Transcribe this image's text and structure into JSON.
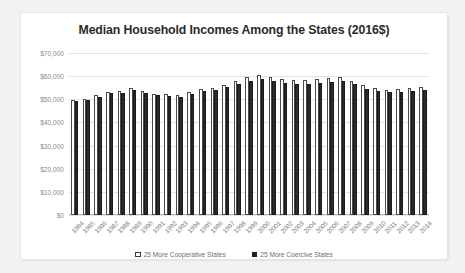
{
  "chart_data": {
    "type": "bar",
    "title": "Median Household Incomes Among the States (2016$)",
    "xlabel": "",
    "ylabel": "",
    "ylim": [
      0,
      70000
    ],
    "ytick_labels": [
      "$70,000",
      "$60,000",
      "$50,000",
      "$40,000",
      "$30,000",
      "$20,000",
      "$10,000",
      "$0"
    ],
    "ytick_values": [
      70000,
      60000,
      50000,
      40000,
      30000,
      20000,
      10000,
      0
    ],
    "grid": true,
    "legend_position": "bottom",
    "categories": [
      "1984",
      "1985",
      "1986",
      "1987",
      "1988",
      "1989",
      "1990",
      "1991",
      "1992",
      "1993",
      "1994",
      "1995",
      "1996",
      "1997",
      "1998",
      "1999",
      "2000",
      "2001",
      "2002",
      "2003",
      "2004",
      "2005",
      "2006",
      "2007",
      "2008",
      "2009",
      "2010",
      "2011",
      "2012",
      "2013",
      "2014"
    ],
    "series": [
      {
        "name": "25 More Cooperative States",
        "color": "#ffffff",
        "values": [
          49500,
          50300,
          52000,
          53200,
          53500,
          54800,
          53700,
          52500,
          52200,
          52000,
          53100,
          54300,
          55000,
          56200,
          58000,
          59800,
          60500,
          59500,
          58800,
          58400,
          58200,
          58600,
          59000,
          59500,
          57800,
          56000,
          55000,
          54200,
          54300,
          54700,
          55400
        ]
      },
      {
        "name": "25 More Coercive States",
        "color": "#2b2b2b",
        "values": [
          49200,
          49800,
          51200,
          52600,
          52800,
          54000,
          52900,
          51700,
          51400,
          51200,
          52200,
          53400,
          54100,
          55100,
          56800,
          58100,
          58600,
          57800,
          57000,
          56700,
          56600,
          57000,
          57600,
          58100,
          56400,
          54600,
          53800,
          53100,
          53200,
          53600,
          54200
        ]
      }
    ]
  },
  "legend": {
    "items": [
      {
        "label": "25 More Cooperative States",
        "style": "coop"
      },
      {
        "label": "25 More Coercive States",
        "style": "coer"
      }
    ]
  }
}
